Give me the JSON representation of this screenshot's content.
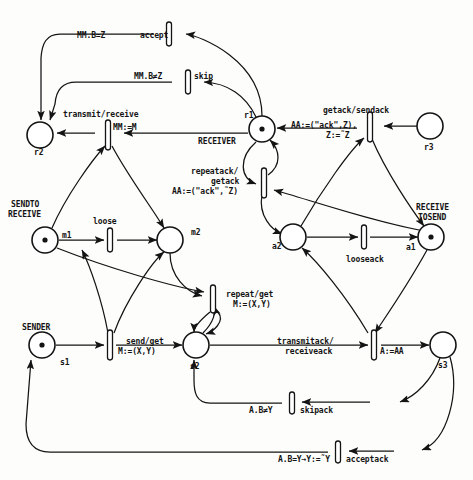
{
  "diagram": {
    "type": "petri-net",
    "places": [
      {
        "id": "r2",
        "label": "r2",
        "cx": 40,
        "cy": 135,
        "r": 13,
        "token": false,
        "name_label": "",
        "lx": 36,
        "ly": 150
      },
      {
        "id": "r1",
        "label": "r1",
        "cx": 262,
        "cy": 129,
        "r": 13,
        "token": true,
        "name_label": "RECEIVER",
        "lx": 232,
        "ly": 113
      },
      {
        "id": "r3",
        "label": "r3",
        "cx": 430,
        "cy": 126,
        "r": 13,
        "token": false,
        "name_label": "",
        "lx": 424,
        "ly": 143
      },
      {
        "id": "m1",
        "label": "m1",
        "cx": 45,
        "cy": 240,
        "r": 13,
        "token": true,
        "name_label": "SENDTO\nRECEIVE",
        "lx": 64,
        "ly": 228
      },
      {
        "id": "m2",
        "label": "m2",
        "cx": 170,
        "cy": 240,
        "r": 13,
        "token": false,
        "name_label": "",
        "lx": 189,
        "ly": 228
      },
      {
        "id": "a2",
        "label": "a2",
        "cx": 293,
        "cy": 237,
        "r": 13,
        "token": false,
        "name_label": "",
        "lx": 272,
        "ly": 240
      },
      {
        "id": "a1",
        "label": "a1",
        "cx": 431,
        "cy": 237,
        "r": 13,
        "token": true,
        "name_label": "RECEIVE\nTOSEND",
        "lx": 408,
        "ly": 240
      },
      {
        "id": "s1",
        "label": "s1",
        "cx": 42,
        "cy": 345,
        "r": 13,
        "token": true,
        "name_label": "SENDER",
        "lx": 59,
        "ly": 357
      },
      {
        "id": "s2",
        "label": "s2",
        "cx": 196,
        "cy": 345,
        "r": 13,
        "token": false,
        "name_label": "",
        "lx": 190,
        "ly": 361
      },
      {
        "id": "s3",
        "label": "s3",
        "cx": 443,
        "cy": 345,
        "r": 13,
        "token": false,
        "name_label": "",
        "lx": 437,
        "ly": 361
      }
    ],
    "transitions": [
      {
        "id": "accept",
        "label": "accept",
        "guard": "MM.B=Z",
        "x": 170,
        "y": 33,
        "vertical": true
      },
      {
        "id": "skip",
        "label": "skip",
        "guard": "MM.B≠Z",
        "x": 188,
        "y": 81,
        "vertical": true
      },
      {
        "id": "transmit",
        "label": "transmit/receive",
        "guard": "MM:=M",
        "x": 108,
        "y": 134,
        "vertical": true
      },
      {
        "id": "getack",
        "label": "getack/sendack",
        "guard": "AA:=(\"ack\",Z),\nZ:=˜Z",
        "x": 370,
        "y": 126,
        "vertical": true
      },
      {
        "id": "repeatack",
        "label": "repeatack/\ngetack",
        "guard": "AA:=(\"ack\",˜Z)",
        "x": 264,
        "y": 184,
        "vertical": true
      },
      {
        "id": "loose",
        "label": "loose",
        "guard": "",
        "x": 110,
        "y": 240,
        "vertical": true
      },
      {
        "id": "looseack",
        "label": "looseack",
        "guard": "",
        "x": 364,
        "y": 237,
        "vertical": true
      },
      {
        "id": "repeat",
        "label": "repeat/get",
        "guard": "M:=(X,Y)",
        "x": 213,
        "y": 299,
        "vertical": true
      },
      {
        "id": "send",
        "label": "send/get",
        "guard": "M:=(X,Y)",
        "x": 110,
        "y": 345,
        "vertical": true
      },
      {
        "id": "transmitack",
        "label": "transmitack/\nreceiveack",
        "guard": "A:=AA",
        "x": 374,
        "y": 345,
        "vertical": true
      },
      {
        "id": "skipack",
        "label": "skipack",
        "guard": "A.B≠Y",
        "x": 292,
        "y": 404,
        "vertical": true
      },
      {
        "id": "acceptack",
        "label": "acceptack",
        "guard": "A.B=Y→Y:=˜Y",
        "x": 338,
        "y": 453,
        "vertical": true
      }
    ],
    "annotations": [
      {
        "id": "accept-guard",
        "text": "MM.B=Z",
        "x": 77,
        "y": 31
      },
      {
        "id": "accept-label",
        "text": "accept",
        "x": 140,
        "y": 31
      },
      {
        "id": "skip-guard",
        "text": "MM.B≠Z",
        "x": 134,
        "y": 72
      },
      {
        "id": "skip-label",
        "text": "skip",
        "x": 194,
        "y": 72
      },
      {
        "id": "transmit-label",
        "text": "transmit/receive",
        "x": 63,
        "y": 110
      },
      {
        "id": "transmit-guard",
        "text": "MM:=M",
        "x": 113,
        "y": 123
      },
      {
        "id": "receiver-label",
        "text": "RECEIVER",
        "x": 198,
        "y": 137
      },
      {
        "id": "r1-label",
        "text": "r1",
        "x": 244,
        "y": 111
      },
      {
        "id": "r2-label",
        "text": "r2",
        "x": 34,
        "y": 148
      },
      {
        "id": "r3-label",
        "text": "r3",
        "x": 424,
        "y": 143
      },
      {
        "id": "getack-label",
        "text": "getack/sendack",
        "x": 323,
        "y": 106
      },
      {
        "id": "getack-guard1",
        "text": "AA:=(\"ack\",Z),",
        "x": 291,
        "y": 121
      },
      {
        "id": "getack-guard2",
        "text": "Z:=˜Z",
        "x": 326,
        "y": 131
      },
      {
        "id": "repeatack-label1",
        "text": "repeatack/",
        "x": 191,
        "y": 167
      },
      {
        "id": "repeatack-label2",
        "text": "getack",
        "x": 211,
        "y": 177
      },
      {
        "id": "repeatack-guard",
        "text": "AA:=(\"ack\",˜Z)",
        "x": 172,
        "y": 187
      },
      {
        "id": "sendto-label1",
        "text": "SENDTO",
        "x": 11,
        "y": 200
      },
      {
        "id": "sendto-label2",
        "text": "RECEIVE",
        "x": 8,
        "y": 210
      },
      {
        "id": "m1-label",
        "text": "m1",
        "x": 62,
        "y": 231
      },
      {
        "id": "m2-label",
        "text": "m2",
        "x": 191,
        "y": 228
      },
      {
        "id": "loose-label",
        "text": "loose",
        "x": 93,
        "y": 217
      },
      {
        "id": "a1-label",
        "text": "a1",
        "x": 406,
        "y": 243
      },
      {
        "id": "a2-label",
        "text": "a2",
        "x": 272,
        "y": 242
      },
      {
        "id": "looseack-label",
        "text": "looseack",
        "x": 346,
        "y": 255
      },
      {
        "id": "receive-label1",
        "text": "RECEIVE",
        "x": 416,
        "y": 203
      },
      {
        "id": "receive-label2",
        "text": "TOSEND",
        "x": 418,
        "y": 213
      },
      {
        "id": "repeat-label",
        "text": "repeat/get",
        "x": 226,
        "y": 290
      },
      {
        "id": "repeat-guard",
        "text": "M:=(X,Y)",
        "x": 233,
        "y": 300
      },
      {
        "id": "sender-label",
        "text": "SENDER",
        "x": 22,
        "y": 323
      },
      {
        "id": "s1-label",
        "text": "s1",
        "x": 60,
        "y": 358
      },
      {
        "id": "s2-label",
        "text": "s2",
        "x": 190,
        "y": 362
      },
      {
        "id": "s3-label",
        "text": "s3",
        "x": 438,
        "y": 361
      },
      {
        "id": "send-label",
        "text": "send/get",
        "x": 126,
        "y": 337
      },
      {
        "id": "send-guard",
        "text": "M:=(X,Y)",
        "x": 118,
        "y": 347
      },
      {
        "id": "transmitack-label1",
        "text": "transmitack/",
        "x": 277,
        "y": 337
      },
      {
        "id": "transmitack-label2",
        "text": "receiveack",
        "x": 285,
        "y": 347
      },
      {
        "id": "transmitack-guard",
        "text": "A:=AA",
        "x": 380,
        "y": 347
      },
      {
        "id": "skipack-guard",
        "text": "A.B≠Y",
        "x": 249,
        "y": 406
      },
      {
        "id": "skipack-label",
        "text": "skipack",
        "x": 300,
        "y": 406
      },
      {
        "id": "acceptack-guard",
        "text": "A.B=Y→Y:=˜Y",
        "x": 278,
        "y": 455
      },
      {
        "id": "acceptack-label",
        "text": "acceptack",
        "x": 346,
        "y": 455
      }
    ],
    "colors": {
      "ink": "#141414",
      "paper": "#fdfdfb"
    }
  }
}
